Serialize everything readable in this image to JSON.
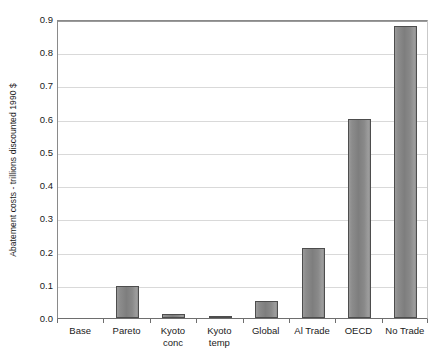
{
  "chart_data": {
    "type": "bar",
    "title": "",
    "xlabel": "",
    "ylabel": "Abatement costs - trillions discounted 1990 $",
    "categories": [
      "Base",
      "Pareto",
      "Kyoto conc",
      "Kyoto temp",
      "Global",
      "Al Trade",
      "OECD",
      "No Trade"
    ],
    "category_lines": [
      [
        "Base"
      ],
      [
        "Pareto"
      ],
      [
        "Kyoto",
        "conc"
      ],
      [
        "Kyoto",
        "temp"
      ],
      [
        "Global"
      ],
      [
        "Al Trade"
      ],
      [
        "OECD"
      ],
      [
        "No Trade"
      ]
    ],
    "values": [
      0.0,
      0.095,
      0.012,
      0.006,
      0.05,
      0.21,
      0.6,
      0.88
    ],
    "ylim": [
      0.0,
      0.9
    ],
    "ytick_labels": [
      "0.0",
      "0.1",
      "0.2",
      "0.3",
      "0.4",
      "0.5",
      "0.6",
      "0.7",
      "0.8",
      "0.9"
    ],
    "ytick_values": [
      0.0,
      0.1,
      0.2,
      0.3,
      0.4,
      0.5,
      0.6,
      0.7,
      0.8,
      0.9
    ],
    "grid": true,
    "legend": false,
    "colors": {
      "bar_fill": "#808080",
      "bar_border": "#4d4d4d",
      "gridline": "#d9d9d9",
      "axis": "#6e6e6e",
      "plot_background": "#ffffff",
      "text": "#1a1a1a"
    }
  }
}
